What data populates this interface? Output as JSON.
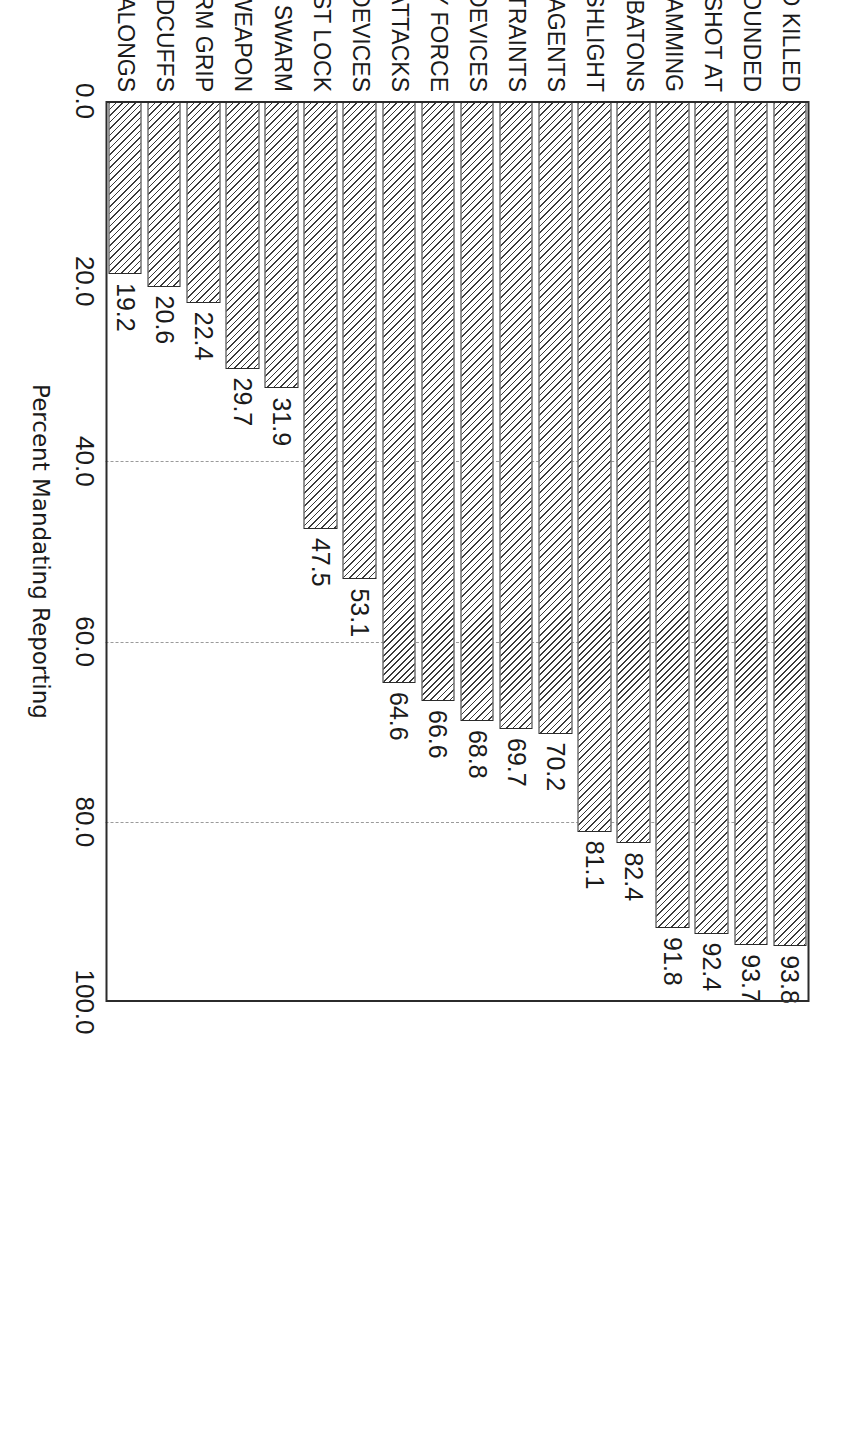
{
  "chart_data": {
    "type": "bar",
    "orientation": "vertical",
    "title": "",
    "xlabel": "",
    "ylabel": "Percent Mandating Reporting",
    "ylim": [
      0.0,
      100.0
    ],
    "ytick_labels": [
      "0.0",
      "20.0",
      "40.0",
      "60.0",
      "80.0",
      "100.0"
    ],
    "ytick_values": [
      0.0,
      20.0,
      40.0,
      60.0,
      80.0,
      100.0
    ],
    "grid": "dashed horizontal gridlines at 40.0, 60.0, 80.0",
    "gridline_values": [
      40.0,
      60.0,
      80.0
    ],
    "legend": null,
    "bar_fill": "white with black 45-degree hatching",
    "bar_edge_color": "#2b2b2b",
    "value_labels_shown": true,
    "categories": [
      "CIVILIANS SHOT AND KILLED",
      "CIVILIANS SHOT AND WOUNDED",
      "CIVILIANS SHOT AT",
      "VEHICLE RAMMING",
      "BATONS",
      "FLASHLIGHT",
      "CHEMICAL AGENTS",
      "NECK RESTRAINTS",
      "OTHER IMPACT DEVICES",
      "BODILY FORCE",
      "DOG ATTACKS",
      "ELECTRICAL DEVICES",
      "TWIST LOCK",
      "SWARM",
      "UNHOLSTER WEAPON",
      "FIRM GRIP",
      "HANDCUFFS",
      "COME-ALONGS"
    ],
    "values": [
      93.8,
      93.7,
      92.4,
      91.8,
      82.4,
      81.1,
      70.2,
      69.7,
      68.8,
      66.6,
      64.6,
      53.1,
      47.5,
      31.9,
      29.7,
      22.4,
      20.6,
      19.2
    ],
    "value_label_text": [
      "93.8",
      "93.7",
      "92.4",
      "91.8",
      "82.4",
      "81.1",
      "70.2",
      "69.7",
      "68.8",
      "66.6",
      "64.6",
      "53.1",
      "47.5",
      "31.9",
      "29.7",
      "22.4",
      "20.6",
      "19.2"
    ]
  },
  "axis": {
    "value_axis_title": "Percent Mandating Reporting"
  }
}
